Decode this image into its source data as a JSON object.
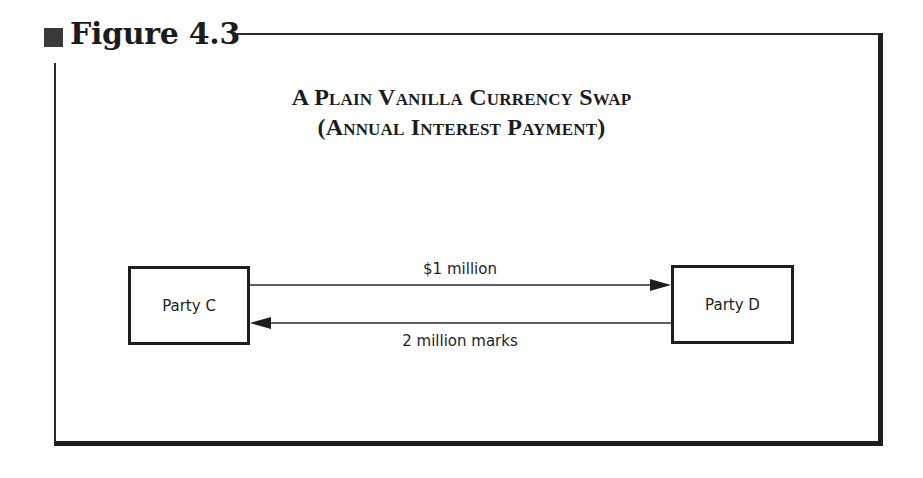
{
  "figure": {
    "caption": "Figure 4.3",
    "title_line1": "A Plain Vanilla Currency Swap",
    "title_line2": "(Annual Interest Payment)"
  },
  "diagram": {
    "nodes": [
      {
        "id": "party_c",
        "label": "Party C"
      },
      {
        "id": "party_d",
        "label": "Party D"
      }
    ],
    "edges": [
      {
        "from": "party_c",
        "to": "party_d",
        "label": "$1 million"
      },
      {
        "from": "party_d",
        "to": "party_c",
        "label": "2 million marks"
      }
    ]
  },
  "colors": {
    "ink": "#1e1e1e",
    "background": "#ffffff"
  }
}
